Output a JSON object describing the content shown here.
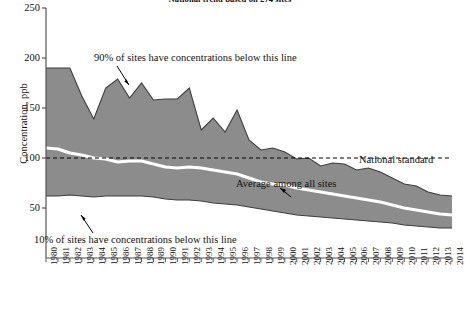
{
  "chart_data": {
    "type": "area",
    "title": "National trend based on 274 sites",
    "subtitle": "",
    "xlabel": "",
    "ylabel": "Concentration, ppb",
    "ylim": [
      0,
      250
    ],
    "xlim": [
      1980,
      2014
    ],
    "grid": false,
    "legend_position": "inline-annotations",
    "y_ticks": [
      50,
      100,
      150,
      200,
      250
    ],
    "x_ticks": [
      "1980",
      "1981",
      "1982",
      "1983",
      "1984",
      "1985",
      "1986",
      "1987",
      "1988",
      "1989",
      "1990",
      "1991",
      "1992",
      "1993",
      "1994",
      "1995",
      "1996",
      "1997",
      "1998",
      "1999",
      "2000",
      "2001",
      "2002",
      "2003",
      "2004",
      "2005",
      "2006",
      "2007",
      "2008",
      "2009",
      "2010",
      "2011",
      "2012",
      "2013",
      "2014"
    ],
    "x": [
      1980,
      1981,
      1982,
      1983,
      1984,
      1985,
      1986,
      1987,
      1988,
      1989,
      1990,
      1991,
      1992,
      1993,
      1994,
      1995,
      1996,
      1997,
      1998,
      1999,
      2000,
      2001,
      2002,
      2003,
      2004,
      2005,
      2006,
      2007,
      2008,
      2009,
      2010,
      2011,
      2012,
      2013,
      2014
    ],
    "series": [
      {
        "name": "90% of sites have concentrations below this line",
        "role": "upper-bound",
        "color": "#8c8c8c",
        "values": [
          190,
          190,
          190,
          162,
          139,
          170,
          179,
          160,
          175,
          158,
          159,
          159,
          170,
          128,
          140,
          126,
          148,
          118,
          108,
          110,
          106,
          99,
          100,
          92,
          95,
          94,
          88,
          90,
          86,
          80,
          74,
          72,
          66,
          63,
          62
        ]
      },
      {
        "name": "Average among all sites",
        "role": "mean",
        "color": "#ffffff",
        "values": [
          110,
          109,
          105,
          103,
          100,
          99,
          96,
          97,
          97,
          94,
          91,
          90,
          91,
          90,
          88,
          86,
          84,
          80,
          76,
          74,
          73,
          70,
          68,
          66,
          64,
          62,
          60,
          58,
          56,
          53,
          50,
          48,
          46,
          44,
          43
        ]
      },
      {
        "name": "10% of sites have concentrations below this line",
        "role": "lower-bound",
        "color": "#8c8c8c",
        "values": [
          62,
          62,
          63,
          62,
          61,
          62,
          62,
          62,
          62,
          61,
          59,
          58,
          58,
          57,
          55,
          54,
          53,
          51,
          49,
          47,
          45,
          43,
          42,
          41,
          40,
          39,
          38,
          37,
          36,
          35,
          33,
          32,
          31,
          30,
          30
        ]
      },
      {
        "name": "National standard",
        "role": "reference-line",
        "color": "#000000",
        "style": "dashed",
        "value": 100
      }
    ],
    "annotations": [
      {
        "id": "annot-p90",
        "text": "90% of sites have concentrations below this line",
        "points_to": "upper-bound"
      },
      {
        "id": "annot-p10",
        "text": "10% of sites have concentrations below this line",
        "points_to": "lower-bound"
      },
      {
        "id": "annot-mean",
        "text": "Average among all sites",
        "points_to": "mean"
      },
      {
        "id": "annot-std",
        "text": "National standard",
        "points_to": "reference-line"
      }
    ],
    "colors": {
      "band_fill": "#8c8c8c",
      "band_edge": "#3d3d3d",
      "mean_line": "#ffffff",
      "standard_line": "#000000",
      "axis": "#555555",
      "background": "#ffffff"
    }
  }
}
